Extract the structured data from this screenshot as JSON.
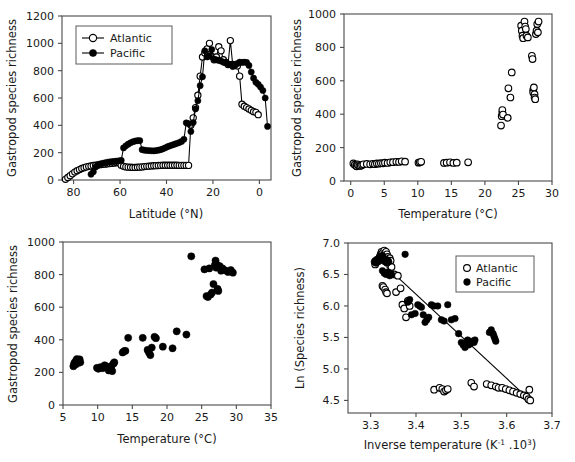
{
  "figure": {
    "panel_count": 4,
    "background": "#ffffff",
    "marker_colors": {
      "atlantic": "#ffffff",
      "pacific": "#000000",
      "outline": "#000000"
    }
  },
  "chart_data": [
    {
      "id": "panel-top-left",
      "type": "line",
      "title": "",
      "xlabel": "Latitude (°N)",
      "ylabel": "Gastropod species richness",
      "xlim": [
        85,
        -5
      ],
      "ylim": [
        0,
        1200
      ],
      "xticks": [
        80,
        60,
        40,
        20,
        0
      ],
      "yticks": [
        0,
        200,
        400,
        600,
        800,
        1000,
        1200
      ],
      "grid": false,
      "legend_position": "top-left",
      "legend": [
        "Atlantic",
        "Pacific"
      ],
      "series": [
        {
          "name": "Atlantic",
          "marker": "open-circle",
          "line": true,
          "x": [
            83.5,
            82.5,
            81.5,
            80.5,
            79.5,
            78.5,
            77.5,
            76.5,
            75.5,
            74.5,
            73.5,
            72.5,
            71.5,
            70.5,
            69.5,
            68.5,
            67.5,
            66.5,
            65.5,
            64.5,
            63.5,
            62.5,
            61.5,
            60.5,
            59.5,
            58.5,
            57.5,
            56.5,
            55.5,
            54.5,
            53.5,
            52.5,
            51.5,
            50.5,
            49.5,
            48.5,
            47.5,
            46.5,
            45.5,
            44.5,
            43.5,
            42.5,
            41.5,
            40.5,
            39.5,
            38.5,
            37.5,
            36.5,
            35.5,
            34.5,
            33.5,
            32.5,
            31.5,
            30.5,
            29.5,
            28.5,
            27.5,
            26.5,
            25.5,
            24.5,
            23.5,
            22.5,
            21.5,
            20.5,
            19.5,
            18.5,
            17.5,
            16.5,
            15.5,
            14.5,
            13.5,
            12.5,
            11.5,
            10.5,
            9.5,
            8.5,
            7.5,
            6.5,
            5.5,
            4.5,
            3.5,
            2.5,
            1.5,
            0.5
          ],
          "y": [
            5,
            18,
            32,
            45,
            58,
            68,
            76,
            84,
            90,
            96,
            100,
            103,
            106,
            108,
            110,
            112,
            114,
            116,
            118,
            120,
            122,
            124,
            126,
            128,
            108,
            100,
            96,
            94,
            93,
            92,
            92,
            93,
            94,
            96,
            98,
            100,
            101,
            103,
            104,
            105,
            106,
            107,
            108,
            108,
            108,
            108,
            108,
            108,
            108,
            107,
            107,
            107,
            107,
            107,
            400,
            455,
            530,
            620,
            760,
            900,
            930,
            960,
            1000,
            905,
            880,
            900,
            975,
            945,
            880,
            860,
            845,
            1020,
            845,
            840,
            835,
            760,
            555,
            540,
            530,
            520,
            510,
            500,
            495,
            478
          ]
        },
        {
          "name": "Pacific",
          "marker": "closed-circle",
          "line": true,
          "x": [
            72.5,
            71.5,
            70.5,
            69.5,
            68.5,
            67.5,
            66.5,
            65.5,
            64.5,
            63.5,
            62.5,
            61.5,
            60.5,
            59.5,
            58.5,
            57.5,
            56.5,
            55.5,
            54.5,
            53.5,
            52.5,
            51.5,
            50.5,
            49.5,
            48.5,
            47.5,
            46.5,
            45.5,
            44.5,
            43.5,
            42.5,
            41.5,
            40.5,
            39.5,
            38.5,
            37.5,
            36.5,
            35.5,
            34.5,
            33.5,
            32.5,
            31.5,
            30.5,
            29.5,
            28.5,
            27.5,
            26.5,
            25.5,
            24.5,
            23.5,
            22.5,
            21.5,
            20.5,
            19.5,
            18.5,
            17.5,
            16.5,
            15.5,
            14.5,
            13.5,
            12.5,
            11.5,
            10.5,
            9.5,
            8.5,
            7.5,
            6.5,
            5.5,
            4.5,
            3.5,
            2.5,
            1.5,
            0.5,
            -0.5,
            -1.5,
            -2.5,
            -3.5
          ],
          "y": [
            42,
            60,
            95,
            110,
            118,
            122,
            126,
            130,
            132,
            134,
            136,
            138,
            140,
            144,
            235,
            250,
            262,
            272,
            280,
            285,
            288,
            288,
            222,
            218,
            216,
            215,
            214,
            213,
            215,
            218,
            222,
            228,
            236,
            244,
            250,
            256,
            262,
            268,
            274,
            282,
            298,
            418,
            412,
            355,
            420,
            520,
            580,
            690,
            755,
            945,
            900,
            910,
            955,
            885,
            880,
            875,
            870,
            862,
            858,
            850,
            845,
            830,
            838,
            852,
            862,
            860,
            862,
            860,
            838,
            790,
            745,
            715,
            700,
            680,
            655,
            600,
            392,
            255
          ]
        }
      ]
    },
    {
      "id": "panel-top-right",
      "type": "scatter",
      "title": "",
      "xlabel": "Temperature (°C)",
      "ylabel": "Gastropod species richness",
      "xlim": [
        -1,
        30
      ],
      "ylim": [
        0,
        1000
      ],
      "xticks": [
        0,
        5,
        10,
        15,
        20,
        25,
        30
      ],
      "yticks": [
        0,
        200,
        400,
        600,
        800,
        1000
      ],
      "grid": false,
      "legend_position": "none",
      "series": [
        {
          "name": "Atlantic",
          "marker": "open-circle",
          "line": false,
          "x": [
            0.4,
            0.6,
            0.8,
            0.9,
            1.0,
            1.1,
            1.3,
            1.5,
            1.7,
            1.9,
            2.4,
            2.9,
            3.3,
            3.6,
            3.9,
            4.2,
            4.5,
            4.8,
            5.1,
            5.5,
            5.9,
            6.3,
            6.8,
            7.2,
            7.6,
            8.1,
            10.1,
            10.3,
            10.5,
            13.9,
            14.3,
            14.8,
            15.3,
            15.8,
            17.5,
            22.4,
            22.5,
            22.6,
            22.6,
            22.7,
            23.4,
            23.5,
            23.8,
            24.0,
            25.4,
            25.5,
            25.6,
            25.7,
            25.9,
            26.0,
            26.1,
            26.2,
            26.4,
            27.0,
            27.1,
            27.2,
            27.2,
            27.3,
            27.4,
            27.4,
            27.5,
            27.6,
            27.7,
            27.8,
            27.9,
            28.0
          ],
          "y": [
            105,
            98,
            92,
            88,
            100,
            95,
            90,
            92,
            96,
            100,
            102,
            100,
            103,
            101,
            105,
            104,
            107,
            106,
            110,
            108,
            112,
            113,
            115,
            114,
            118,
            116,
            110,
            112,
            115,
            108,
            110,
            112,
            108,
            110,
            112,
            332,
            388,
            410,
            425,
            398,
            378,
            555,
            500,
            650,
            930,
            900,
            870,
            855,
            955,
            925,
            910,
            870,
            860,
            750,
            730,
            545,
            530,
            560,
            520,
            500,
            490,
            880,
            900,
            940,
            890,
            955
          ]
        }
      ]
    },
    {
      "id": "panel-bottom-left",
      "type": "scatter",
      "title": "",
      "xlabel": "Temperature (°C)",
      "ylabel": "Gastropod species richness",
      "xlim": [
        5,
        35
      ],
      "ylim": [
        0,
        1000
      ],
      "xticks": [
        5,
        10,
        15,
        20,
        25,
        30,
        35
      ],
      "yticks": [
        0,
        200,
        400,
        600,
        800,
        1000
      ],
      "grid": false,
      "legend_position": "none",
      "series": [
        {
          "name": "Pacific",
          "marker": "closed-circle",
          "line": false,
          "x": [
            6.5,
            6.6,
            6.7,
            6.8,
            6.9,
            7.0,
            7.1,
            7.2,
            7.3,
            7.4,
            7.5,
            9.9,
            10.1,
            10.4,
            10.7,
            11.0,
            11.2,
            11.4,
            11.6,
            11.8,
            12.0,
            12.1,
            12.3,
            12.4,
            13.6,
            13.8,
            14.0,
            14.4,
            16.5,
            17.2,
            17.4,
            17.6,
            17.8,
            18.2,
            18.4,
            19.4,
            20.8,
            21.4,
            22.8,
            23.5,
            25.4,
            25.7,
            25.9,
            26.1,
            26.3,
            26.5,
            26.7,
            26.9,
            27.0,
            27.1,
            27.2,
            27.3,
            27.4,
            27.6,
            27.8,
            28.0,
            28.4,
            28.8,
            29.2,
            29.5
          ],
          "y": [
            238,
            252,
            262,
            248,
            272,
            282,
            268,
            258,
            274,
            280,
            262,
            228,
            222,
            232,
            226,
            244,
            238,
            230,
            212,
            222,
            240,
            208,
            255,
            262,
            322,
            330,
            332,
            412,
            412,
            338,
            322,
            306,
            352,
            418,
            410,
            358,
            348,
            452,
            432,
            912,
            832,
            668,
            662,
            838,
            678,
            690,
            742,
            858,
            886,
            842,
            860,
            712,
            700,
            852,
            824,
            838,
            826,
            816,
            828,
            812
          ]
        }
      ]
    },
    {
      "id": "panel-bottom-right",
      "type": "scatter",
      "title": "",
      "xlabel": "Inverse temperature (K⁻¹ .10³)",
      "xlabel_parts": {
        "base": "Inverse temperature (K",
        "sup1": "-1",
        "mid": " .10",
        "sup2": "3",
        "tail": ")"
      },
      "ylabel": "Ln (Species richness)",
      "xlim": [
        3.25,
        3.7
      ],
      "ylim": [
        4.3,
        7.0
      ],
      "xticks": [
        3.3,
        3.4,
        3.5,
        3.6,
        3.7
      ],
      "yticks": [
        4.5,
        5.0,
        5.5,
        6.0,
        6.5,
        7.0
      ],
      "grid": false,
      "legend_position": "top-right",
      "legend": [
        "Atlantic",
        "Pacific"
      ],
      "fit_line": {
        "x": [
          3.335,
          3.655
        ],
        "y": [
          6.62,
          4.48
        ]
      },
      "series": [
        {
          "name": "Atlantic",
          "marker": "open-circle",
          "line": false,
          "x": [
            3.31,
            3.312,
            3.315,
            3.318,
            3.32,
            3.322,
            3.324,
            3.326,
            3.328,
            3.33,
            3.33,
            3.332,
            3.334,
            3.336,
            3.338,
            3.34,
            3.342,
            3.344,
            3.326,
            3.328,
            3.332,
            3.334,
            3.336,
            3.346,
            3.352,
            3.356,
            3.36,
            3.366,
            3.37,
            3.374,
            3.378,
            3.382,
            3.386,
            3.44,
            3.452,
            3.458,
            3.462,
            3.466,
            3.47,
            3.522,
            3.528,
            3.556,
            3.566,
            3.576,
            3.582,
            3.59,
            3.598,
            3.606,
            3.614,
            3.622,
            3.63,
            3.638,
            3.644,
            3.648,
            3.652,
            3.65
          ],
          "y": [
            6.66,
            6.7,
            6.72,
            6.74,
            6.78,
            6.82,
            6.86,
            6.84,
            6.8,
            6.76,
            6.88,
            6.84,
            6.86,
            6.82,
            6.78,
            6.74,
            6.76,
            6.72,
            6.32,
            6.3,
            6.26,
            6.22,
            6.2,
            6.62,
            6.5,
            6.22,
            6.48,
            6.28,
            6.02,
            5.96,
            5.82,
            6.08,
            6.0,
            4.67,
            4.7,
            4.68,
            4.64,
            4.66,
            4.68,
            4.78,
            4.72,
            4.76,
            4.74,
            4.72,
            4.7,
            4.7,
            4.68,
            4.66,
            4.64,
            4.62,
            4.6,
            4.58,
            4.56,
            4.52,
            4.5,
            4.67
          ]
        },
        {
          "name": "Pacific",
          "marker": "closed-circle",
          "line": false,
          "x": [
            3.308,
            3.31,
            3.312,
            3.314,
            3.316,
            3.318,
            3.32,
            3.322,
            3.324,
            3.326,
            3.328,
            3.33,
            3.332,
            3.334,
            3.336,
            3.338,
            3.34,
            3.326,
            3.33,
            3.334,
            3.338,
            3.342,
            3.344,
            3.346,
            3.376,
            3.382,
            3.386,
            3.39,
            3.398,
            3.404,
            3.408,
            3.412,
            3.416,
            3.42,
            3.424,
            3.428,
            3.434,
            3.44,
            3.448,
            3.456,
            3.462,
            3.47,
            3.478,
            3.486,
            3.494,
            3.5,
            3.504,
            3.508,
            3.51,
            3.512,
            3.514,
            3.516,
            3.518,
            3.52,
            3.524,
            3.528,
            3.53,
            3.562,
            3.566,
            3.57,
            3.572,
            3.574,
            3.576
          ],
          "y": [
            6.7,
            6.72,
            6.68,
            6.74,
            6.7,
            6.76,
            6.72,
            6.78,
            6.74,
            6.8,
            6.76,
            6.72,
            6.7,
            6.74,
            6.68,
            6.72,
            6.7,
            6.56,
            6.52,
            6.5,
            6.54,
            6.48,
            6.52,
            6.5,
            6.82,
            6.06,
            6.1,
            5.86,
            5.88,
            6.02,
            6.0,
            5.98,
            5.86,
            5.74,
            5.78,
            5.82,
            6.02,
            6.0,
            6.0,
            5.78,
            5.76,
            6.02,
            5.78,
            5.8,
            5.56,
            5.42,
            5.38,
            5.34,
            5.4,
            5.44,
            5.46,
            5.38,
            5.42,
            5.4,
            5.44,
            5.42,
            5.46,
            5.58,
            5.62,
            5.56,
            5.52,
            5.48,
            5.44
          ]
        }
      ]
    }
  ]
}
